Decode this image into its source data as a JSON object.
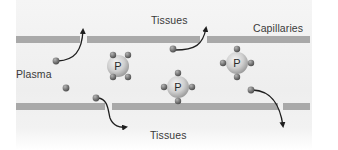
{
  "diagram": {
    "type": "capillary-plasma-exchange",
    "labels": {
      "tissues_top": "Tissues",
      "capillaries": "Capillaries",
      "plasma": "Plasma",
      "tissues_bottom": "Tissues"
    },
    "protein_label": "P",
    "proteins": [
      {
        "id": "protein-1",
        "label": "P"
      },
      {
        "id": "protein-2",
        "label": "P"
      },
      {
        "id": "protein-3",
        "label": "P"
      }
    ],
    "colors": {
      "membrane": "#a9a9a9",
      "protein_fill": "#c8c8c8",
      "small_molecule": "#6e6e6e",
      "arrow": "#1e1e1e",
      "text": "#3a3a3a"
    }
  }
}
